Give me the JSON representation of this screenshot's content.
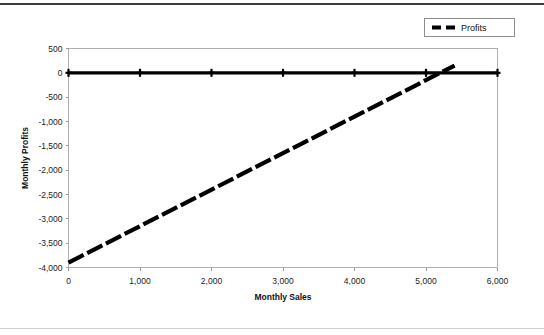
{
  "chart_data": {
    "type": "line",
    "title": "",
    "xlabel": "Monthly Sales",
    "ylabel": "Monthly Profits",
    "xlim": [
      0,
      6000
    ],
    "ylim": [
      -4000,
      500
    ],
    "grid": false,
    "legend_position": "top-right",
    "x_ticks": [
      "0",
      "1,000",
      "2,000",
      "3,000",
      "4,000",
      "5,000",
      "6,000"
    ],
    "x_tick_values": [
      0,
      1000,
      2000,
      3000,
      4000,
      5000,
      6000
    ],
    "y_ticks": [
      "500",
      "0",
      "-500",
      "-1,000",
      "-1,500",
      "-2,000",
      "-2,500",
      "-3,000",
      "-3,500",
      "-4,000"
    ],
    "y_tick_values": [
      500,
      0,
      -500,
      -1000,
      -1500,
      -2000,
      -2500,
      -3000,
      -3500,
      -4000
    ],
    "series": [
      {
        "name": "Zero Axis",
        "style": "solid",
        "marker": "cross",
        "x": [
          0,
          1000,
          2000,
          3000,
          4000,
          5000,
          6000
        ],
        "values": [
          0,
          0,
          0,
          0,
          0,
          0,
          0
        ]
      },
      {
        "name": "Profits",
        "style": "dashed",
        "marker": "none",
        "x": [
          0,
          5400
        ],
        "values": [
          -3900,
          150
        ]
      }
    ],
    "legend": [
      {
        "label": "Profits",
        "style": "dashed",
        "color": "#000000"
      }
    ]
  },
  "colors": {
    "series": "#000000",
    "axis": "#b0b0b0",
    "text": "#111111",
    "rule_top": "#3c3c3c",
    "rule_bottom": "#cfcfcf",
    "background": "#ffffff"
  }
}
